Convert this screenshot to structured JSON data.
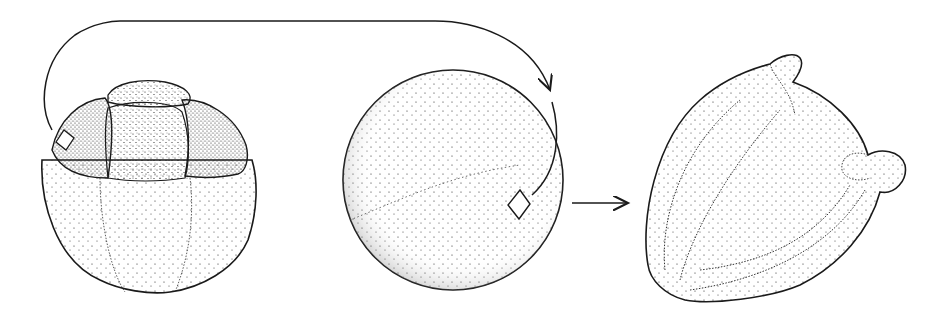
{
  "diagram": {
    "type": "stippled scientific illustration",
    "stages": [
      {
        "id": "cluster",
        "label": "segmented spherical cluster with highlighted cell (diamond marker)"
      },
      {
        "id": "sphere",
        "label": "isolated spherical cell with diamond marker"
      },
      {
        "id": "grain",
        "label": "mature grain with furrows and two bulging pores"
      }
    ],
    "connectors": [
      {
        "from": "cluster",
        "to": "sphere",
        "style": "curved arrow over top"
      },
      {
        "from": "sphere",
        "to": "grain",
        "style": "straight arrow"
      }
    ],
    "colors": {
      "ink": "#1a1a1a",
      "background": "#ffffff"
    }
  }
}
